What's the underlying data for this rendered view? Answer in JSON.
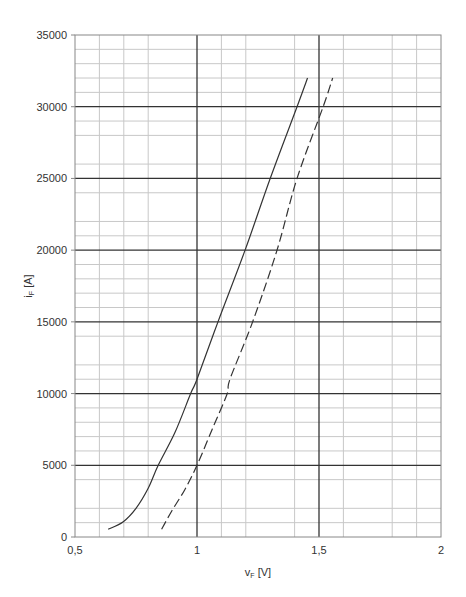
{
  "chart_data": {
    "type": "line",
    "title": "",
    "xlabel": "vF [V]",
    "xlabel_main": "v",
    "xlabel_sub": "F",
    "xlabel_unit": " [V]",
    "ylabel": "iF [A]",
    "ylabel_main": "i",
    "ylabel_sub": "F",
    "ylabel_unit": " [A]",
    "xlim": [
      0.5,
      2
    ],
    "ylim": [
      0,
      35000
    ],
    "x_ticks": [
      0.5,
      1,
      1.5,
      2
    ],
    "x_tick_labels": [
      "0,5",
      "1",
      "1,5",
      "2"
    ],
    "y_ticks": [
      0,
      5000,
      10000,
      15000,
      20000,
      25000,
      30000,
      35000
    ],
    "y_tick_labels": [
      "0",
      "5000",
      "10000",
      "15000",
      "20000",
      "25000",
      "30000",
      "35000"
    ],
    "grid": true,
    "minor_x_gridlines": [
      0.6,
      0.7,
      0.8,
      1.1,
      1.2,
      1.4,
      1.6,
      1.8,
      1.9
    ],
    "minor_y_gridlines": [
      1000,
      2000,
      4000,
      6000,
      7000,
      8000,
      9000,
      11000,
      12000,
      14000,
      16000,
      17000,
      18000,
      19000,
      21000,
      22000,
      24000,
      26000,
      28000,
      29000,
      31000,
      32000,
      33000,
      34000
    ],
    "legend": null,
    "series": [
      {
        "name": "solid",
        "style": "solid",
        "color": "#333333",
        "x": [
          0.636,
          0.698,
          0.75,
          0.8,
          0.841,
          0.91,
          0.974,
          1.0,
          1.086,
          1.197,
          1.3,
          1.41,
          1.453
        ],
        "y": [
          540,
          1070,
          2000,
          3400,
          5000,
          7300,
          10000,
          11000,
          15000,
          20000,
          25000,
          30000,
          32000
        ]
      },
      {
        "name": "dashed",
        "style": "dashed",
        "color": "#333333",
        "x": [
          0.855,
          0.896,
          0.95,
          1.0,
          1.062,
          1.124,
          1.135,
          1.228,
          1.328,
          1.41,
          1.517,
          1.556
        ],
        "y": [
          540,
          1800,
          3300,
          5000,
          7500,
          10000,
          11000,
          15000,
          20000,
          25000,
          30000,
          32000
        ]
      }
    ]
  }
}
